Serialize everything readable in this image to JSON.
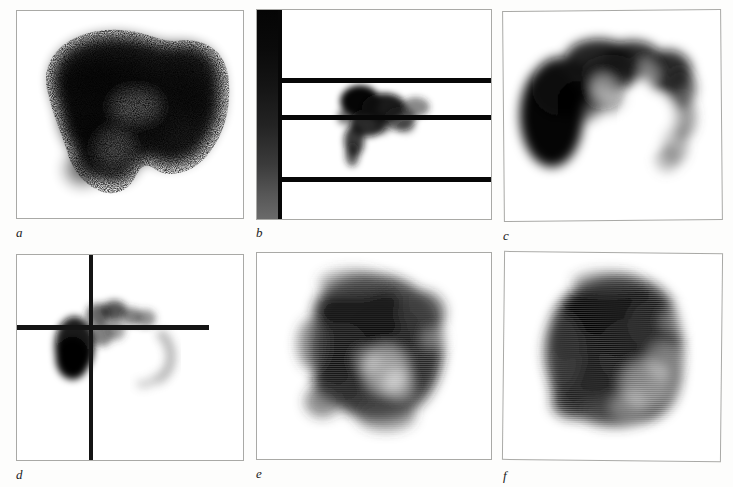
{
  "figure": {
    "kind": "scintigraphy-image-plate",
    "background_color": "#fdfdfc",
    "frame_color": "#a9a9a6",
    "ink_color": "#0a0a0a",
    "columns": 3,
    "rows": 2,
    "panel_count": 6
  },
  "panels": [
    {
      "id": "a",
      "label": "a",
      "description": "Grainy high-count planar liver scintigram; broad dark uptake mass spanning most of the field with a notch along the lower border.",
      "texture": "speckled-grain",
      "overlays": []
    },
    {
      "id": "b",
      "label": "b",
      "description": "Scintigram with vertical grey-scale calibration bar at the left and three horizontal black marker lines; small dense focus of uptake in the middle band.",
      "texture": "smooth-blur",
      "overlays": [
        "grayscale-bar",
        "marker-line-1",
        "marker-line-2",
        "marker-line-3"
      ]
    },
    {
      "id": "c",
      "label": "c",
      "description": "Horseshoe / crescent shaped tracer distribution, dense at the left and upper margin, thinning to a faint tail on the right.",
      "texture": "smooth-blur",
      "overlays": []
    },
    {
      "id": "d",
      "label": "d",
      "description": "Scintigram with crosshair reference markers; one vertical line and one horizontal line crossing near a small intense focus, plus a faint arc to the right.",
      "texture": "smooth-blur",
      "overlays": [
        "crosshair-vertical",
        "crosshair-horizontal"
      ]
    },
    {
      "id": "e",
      "label": "e",
      "description": "Raster-textured scintigram with irregular dark uptake across the centre and a lighter defect region toward the lower right.",
      "texture": "raster-lines",
      "overlays": []
    },
    {
      "id": "f",
      "label": "f",
      "description": "Raster-textured scintigram showing a large, fairly uniform dark organ silhouette with a lighter zone at the lower right margin.",
      "texture": "raster-lines",
      "overlays": []
    }
  ],
  "panel_b_overlay": {
    "grayscale_bar": {
      "name": "grey-scale-calibration-bar",
      "orientation": "vertical",
      "top_color": "#050505",
      "bottom_color": "#6a6a6a"
    },
    "marker_lines": [
      {
        "name": "marker-line-1",
        "y": 68
      },
      {
        "name": "marker-line-2",
        "y": 105
      },
      {
        "name": "marker-line-3",
        "y": 167
      }
    ]
  },
  "panel_d_overlay": {
    "crosshair": {
      "name": "crosshair-marker",
      "vertical_x": 72,
      "horizontal_y": 70,
      "horizontal_extent": 192,
      "color": "#141414"
    }
  }
}
